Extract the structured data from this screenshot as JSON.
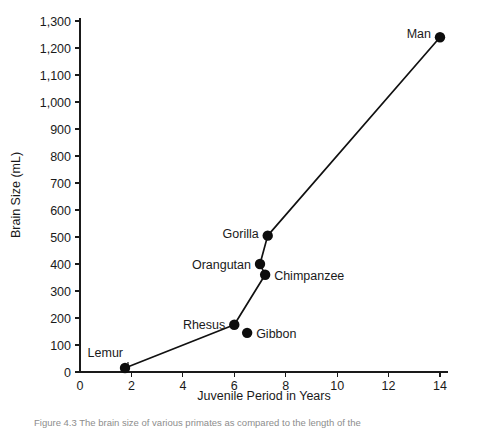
{
  "figure": {
    "caption": "Figure 4.3  The brain size of various primates as compared to the length of the"
  },
  "chart_data": {
    "type": "line",
    "title": "",
    "xlabel": "Juvenile Period in Years",
    "ylabel": "Brain Size (mL)",
    "xlim": [
      0,
      14
    ],
    "ylim": [
      0,
      1300
    ],
    "grid": false,
    "legend": "none",
    "xticks": [
      0,
      2,
      4,
      6,
      8,
      10,
      12,
      14
    ],
    "xtick_labels": [
      "0",
      "2",
      "4",
      "6",
      "8",
      "10",
      "12",
      "14"
    ],
    "yticks": [
      0,
      100,
      200,
      300,
      400,
      500,
      600,
      700,
      800,
      900,
      1000,
      1100,
      1200,
      1300
    ],
    "ytick_labels": [
      "0",
      "100",
      "200",
      "300",
      "400",
      "500",
      "600",
      "700",
      "800",
      "900",
      "1,000",
      "1,100",
      "1,200",
      "1,300"
    ],
    "points": [
      {
        "name": "Lemur",
        "x": 1.75,
        "y": 15,
        "label": "Lemur",
        "label_side": "left"
      },
      {
        "name": "Rhesus",
        "x": 6.0,
        "y": 175,
        "label": "Rhesus",
        "label_side": "left"
      },
      {
        "name": "Gibbon",
        "x": 6.5,
        "y": 145,
        "label": "Gibbon",
        "label_side": "right"
      },
      {
        "name": "Orangutan",
        "x": 7.0,
        "y": 400,
        "label": "Orangutan",
        "label_side": "left"
      },
      {
        "name": "Chimpanzee",
        "x": 7.2,
        "y": 360,
        "label": "Chimpanzee",
        "label_side": "right"
      },
      {
        "name": "Gorilla",
        "x": 7.3,
        "y": 505,
        "label": "Gorilla",
        "label_side": "left"
      },
      {
        "name": "Man",
        "x": 14.0,
        "y": 1240,
        "label": "Man",
        "label_side": "left"
      }
    ],
    "line_path": [
      "Lemur",
      "Rhesus",
      "Chimpanzee",
      "Orangutan",
      "Gorilla",
      "Man"
    ],
    "colors": {
      "marker": "#0d0d0d",
      "line": "#111111",
      "axis": "#1a1a1a",
      "background": "#ffffff"
    }
  }
}
